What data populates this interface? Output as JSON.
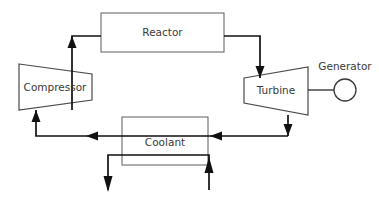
{
  "diagram": {
    "type": "process-flow-diagram",
    "canvas": {
      "width": 379,
      "height": 198,
      "background": "#ffffff"
    },
    "colors": {
      "background": "#ffffff",
      "pipe": "#111111",
      "component_outline": "#5a5a5a",
      "label_text": "#3a3a3a",
      "shaft": "#2b2b2b"
    },
    "components": [
      {
        "id": "reactor",
        "label": "Reactor",
        "shape": "rectangle",
        "box": {
          "x": 101,
          "y": 13,
          "width": 123,
          "height": 39
        },
        "label_position": {
          "x": 162.5,
          "y": 33
        }
      },
      {
        "id": "compressor",
        "label": "Compressor",
        "shape": "trapezoid-left-tall",
        "box": {
          "x": 19,
          "y": 64,
          "width": 73,
          "height": 46
        },
        "points": "19,64 92,74 92,100 19,110",
        "label_position": {
          "x": 55,
          "y": 88
        }
      },
      {
        "id": "turbine",
        "label": "Turbine",
        "shape": "trapezoid-right-tall",
        "box": {
          "x": 244,
          "y": 67,
          "width": 64,
          "height": 48
        },
        "points": "244,78 308,67 308,115 244,103",
        "label_position": {
          "x": 276,
          "y": 91
        }
      },
      {
        "id": "generator",
        "label": "Generator",
        "shape": "circle",
        "circle": {
          "cx": 345,
          "cy": 90,
          "r": 11
        },
        "label_position": {
          "x": 345,
          "y": 67
        }
      },
      {
        "id": "coolant",
        "label": "Coolant",
        "shape": "rectangle",
        "box": {
          "x": 122,
          "y": 117,
          "width": 86,
          "height": 48
        },
        "label_position": {
          "x": 165,
          "y": 143
        }
      }
    ],
    "flows": [
      {
        "id": "compressor-to-reactor",
        "from": "compressor",
        "to": "reactor",
        "direction": "up",
        "path": "M 72,110 L 72,36 L 101,36",
        "arrow_at": {
          "x": 72,
          "y": 44,
          "dir": "up"
        }
      },
      {
        "id": "reactor-to-turbine",
        "from": "reactor",
        "to": "turbine",
        "direction": "down",
        "path": "M 224,36 L 260,36 L 260,78",
        "arrow_at": {
          "x": 260,
          "y": 70,
          "dir": "down"
        }
      },
      {
        "id": "turbine-to-coolant",
        "from": "turbine",
        "to": "coolant-return",
        "direction": "down",
        "path": "M 288,115 L 288,136 L 36,136",
        "arrow_at": {
          "x": 288,
          "y": 126,
          "dir": "down"
        }
      },
      {
        "id": "return-line-right-segment",
        "from": "turbine-downcomer",
        "to": "coolant",
        "direction": "left",
        "arrow_at": {
          "x": 210,
          "y": 136,
          "dir": "left"
        }
      },
      {
        "id": "return-line-left-segment",
        "from": "coolant",
        "to": "compressor",
        "direction": "left",
        "arrow_at": {
          "x": 86,
          "y": 136,
          "dir": "left"
        }
      },
      {
        "id": "return-to-compressor",
        "from": "return-line",
        "to": "compressor",
        "direction": "up",
        "path": "M 36,136 L 36,110",
        "arrow_at": {
          "x": 36,
          "y": 117,
          "dir": "up"
        }
      },
      {
        "id": "coolant-outlet",
        "from": "coolant",
        "to": "heat-sink",
        "direction": "down",
        "path": "M 108,155 L 209,155",
        "arrow_at": {
          "x": 108,
          "y": 190,
          "dir": "down"
        }
      },
      {
        "id": "coolant-inlet",
        "from": "heat-source",
        "to": "coolant",
        "direction": "up",
        "path": "M 209,190 L 209,155",
        "arrow_at": {
          "x": 209,
          "y": 160,
          "dir": "up"
        }
      }
    ]
  }
}
